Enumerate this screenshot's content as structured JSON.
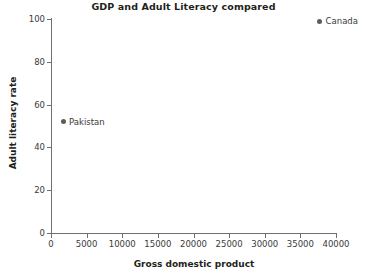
{
  "chart_data": {
    "type": "scatter",
    "title": "GDP and Adult Literacy compared",
    "xlabel": "Gross domestic product",
    "ylabel": "Adult literacy rate",
    "xlim": [
      0,
      40000
    ],
    "ylim": [
      0,
      100
    ],
    "xticks": [
      0,
      5000,
      10000,
      15000,
      20000,
      25000,
      30000,
      35000,
      40000
    ],
    "xtick_labels": [
      "0",
      "5000",
      "10000",
      "15000",
      "20000",
      "25000",
      "30000",
      "35000",
      "40000"
    ],
    "yticks": [
      0,
      20,
      40,
      60,
      80,
      100
    ],
    "ytick_labels": [
      "0",
      "20",
      "40",
      "60",
      "80",
      "100"
    ],
    "grid": false,
    "legend": "none",
    "marker_color": "#5c5c5c",
    "axis_color": "#6f6f6f",
    "background": "#ffffff",
    "points": [
      {
        "label": "Pakistan",
        "x": 1700,
        "y": 52
      },
      {
        "label": "Canada",
        "x": 37700,
        "y": 99
      }
    ]
  }
}
